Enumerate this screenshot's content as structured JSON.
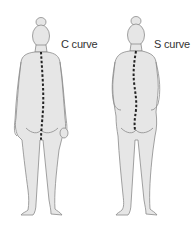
{
  "figures": [
    {
      "id": "c-curve",
      "label": "C curve"
    },
    {
      "id": "s-curve",
      "label": "S curve"
    }
  ],
  "colors": {
    "body_fill": "#e6e6e6",
    "outline": "#8a8a8a",
    "spine": "#222222"
  }
}
